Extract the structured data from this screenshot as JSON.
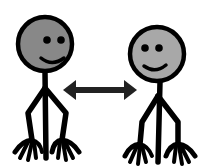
{
  "figure": {
    "caption": "Two smiling stick figures facing each other with a double-headed arrow between them",
    "background_color": "#ffffff",
    "line_color": "#000000"
  },
  "people": [
    {
      "name": "person-left",
      "label": "Person 1",
      "head_fill": "#888888",
      "expression": "smile"
    },
    {
      "name": "person-right",
      "label": "Person 2",
      "head_fill": "#a8a8a8",
      "expression": "smile"
    }
  ],
  "connector": {
    "type": "double-headed-arrow",
    "label": "interaction",
    "color": "#222222"
  }
}
